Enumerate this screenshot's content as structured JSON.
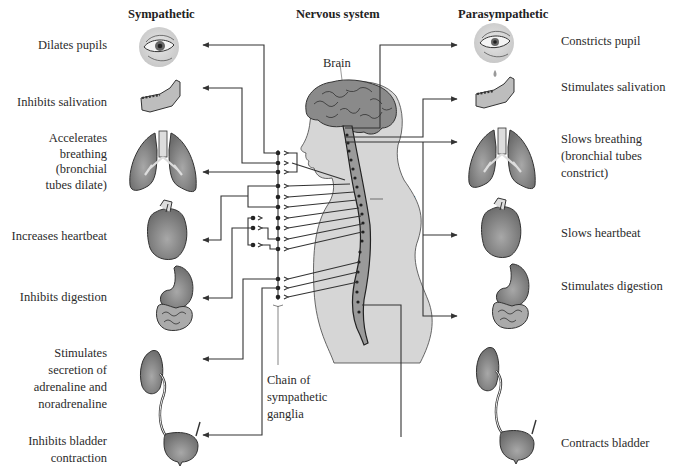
{
  "headers": {
    "sympathetic": "Sympathetic",
    "nervous_system": "Nervous system",
    "parasympathetic": "Parasympathetic"
  },
  "sympathetic_effects": [
    {
      "organ": "eye",
      "label": "Dilates pupils"
    },
    {
      "organ": "salivary-gland",
      "label": "Inhibits salivation"
    },
    {
      "organ": "lungs",
      "label": "Accelerates breathing (bronchial tubes dilate)",
      "lines": [
        "Accelerates",
        "breathing",
        "(bronchial",
        "tubes dilate)"
      ]
    },
    {
      "organ": "heart",
      "label": "Increases heartbeat"
    },
    {
      "organ": "stomach-intestines",
      "label": "Inhibits digestion"
    },
    {
      "organ": "adrenal-gland",
      "label": "Stimulates secretion of adrenaline and noradrenaline",
      "lines": [
        "Stimulates",
        "secretion of",
        "adrenaline and",
        "noradrenaline"
      ]
    },
    {
      "organ": "bladder",
      "label": "Inhibits bladder contraction",
      "lines": [
        "Inhibits bladder",
        "contraction"
      ]
    }
  ],
  "parasympathetic_effects": [
    {
      "organ": "eye",
      "label": "Constricts pupil"
    },
    {
      "organ": "salivary-gland",
      "label": "Stimulates salivation"
    },
    {
      "organ": "lungs",
      "label": "Slows breathing (bronchial tubes constrict)",
      "lines": [
        "Slows breathing",
        "(bronchial tubes",
        "constrict)"
      ]
    },
    {
      "organ": "heart",
      "label": "Slows heartbeat"
    },
    {
      "organ": "stomach-intestines",
      "label": "Stimulates digestion"
    },
    {
      "organ": "bladder",
      "label": "Contracts bladder"
    }
  ],
  "annotations": {
    "brain": "Brain",
    "spinal_cord_1": "Spinal",
    "spinal_cord_2": "cord",
    "ganglia_1": "Chain of",
    "ganglia_2": "sympathetic",
    "ganglia_3": "ganglia"
  },
  "colors": {
    "line": "#333333",
    "organ_fill": "#7d7d7d",
    "organ_dark": "#555555",
    "body_fill": "#d6d6d6",
    "brain_fill": "#888888",
    "eye_bg": "#d9d9d9"
  }
}
